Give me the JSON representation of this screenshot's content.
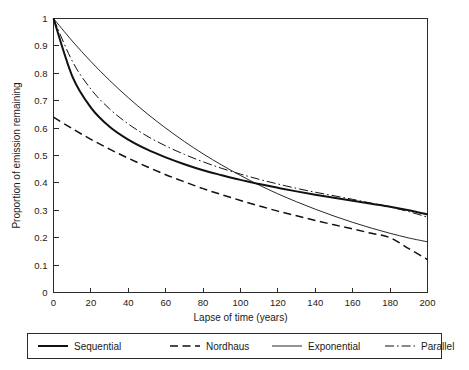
{
  "chart_data": {
    "type": "line",
    "title": "",
    "xlabel": "Lapse of time (years)",
    "ylabel": "Proportion of emission remaining",
    "xlim": [
      0,
      200
    ],
    "ylim": [
      0,
      1
    ],
    "grid": false,
    "legend_position": "bottom-outside",
    "xticks": [
      0,
      20,
      40,
      60,
      80,
      100,
      120,
      140,
      160,
      180,
      200
    ],
    "xticklabels": [
      "0",
      "20",
      "40",
      "60",
      "80",
      "100",
      "120",
      "140",
      "160",
      "180",
      "200"
    ],
    "yticks": [
      0,
      0.1,
      0.2,
      0.3,
      0.4,
      0.5,
      0.6,
      0.7,
      0.8,
      0.9,
      1
    ],
    "yticklabels": [
      "0",
      "0.1",
      "0.2",
      "0.3",
      "0.4",
      "0.5",
      "0.6",
      "0.7",
      "0.8",
      "0.9",
      "1"
    ],
    "x": [
      0,
      10,
      20,
      30,
      40,
      50,
      60,
      70,
      80,
      90,
      100,
      110,
      120,
      130,
      140,
      150,
      160,
      170,
      180,
      190,
      200
    ],
    "series": [
      {
        "name": "Sequential",
        "style": "solid-thick",
        "color": "#111111",
        "values": [
          1.0,
          0.79,
          0.675,
          0.605,
          0.558,
          0.522,
          0.493,
          0.468,
          0.446,
          0.428,
          0.411,
          0.396,
          0.382,
          0.369,
          0.357,
          0.346,
          0.335,
          0.324,
          0.313,
          0.3,
          0.285
        ]
      },
      {
        "name": "Nordhaus",
        "style": "dashed",
        "color": "#111111",
        "values": [
          0.64,
          0.598,
          0.559,
          0.523,
          0.49,
          0.459,
          0.43,
          0.404,
          0.379,
          0.357,
          0.336,
          0.316,
          0.297,
          0.28,
          0.263,
          0.247,
          0.232,
          0.216,
          0.2,
          0.16,
          0.12
        ]
      },
      {
        "name": "Exponential",
        "style": "solid-thin",
        "color": "#111111",
        "values": [
          1.0,
          0.918,
          0.843,
          0.774,
          0.711,
          0.653,
          0.6,
          0.551,
          0.506,
          0.465,
          0.427,
          0.392,
          0.36,
          0.331,
          0.304,
          0.279,
          0.256,
          0.235,
          0.216,
          0.199,
          0.185
        ]
      },
      {
        "name": "Parallel",
        "style": "dash-dot",
        "color": "#111111",
        "values": [
          1.0,
          0.845,
          0.742,
          0.67,
          0.615,
          0.571,
          0.535,
          0.504,
          0.477,
          0.453,
          0.432,
          0.413,
          0.396,
          0.38,
          0.366,
          0.353,
          0.34,
          0.326,
          0.312,
          0.295,
          0.275
        ]
      }
    ]
  },
  "legend": {
    "items": [
      {
        "label": "Sequential",
        "style": "solid-thick"
      },
      {
        "label": "Nordhaus",
        "style": "dashed"
      },
      {
        "label": "Exponential",
        "style": "solid-thin"
      },
      {
        "label": "Parallel",
        "style": "dash-dot"
      }
    ]
  }
}
